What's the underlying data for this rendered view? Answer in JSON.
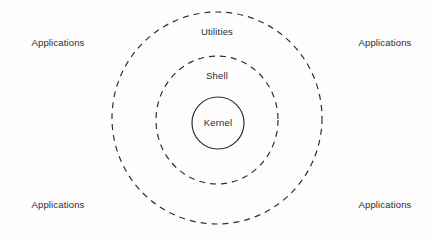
{
  "diagram": {
    "background_color": "#fdfdfd",
    "stroke_color": "#2f2f2f",
    "text_color": "#2b2b2b",
    "rings": [
      {
        "id": "utilities",
        "label": "Utilities",
        "shape": "ellipse",
        "style": "dashed",
        "cx": 217,
        "cy": 118,
        "rx": 105,
        "ry": 106,
        "label_x": 217,
        "label_y": 32
      },
      {
        "id": "shell",
        "label": "Shell",
        "shape": "ellipse",
        "style": "dashed",
        "cx": 217,
        "cy": 120,
        "rx": 61,
        "ry": 64,
        "label_x": 217,
        "label_y": 76
      },
      {
        "id": "kernel",
        "label": "Kernel",
        "shape": "circle",
        "style": "solid",
        "cx": 218,
        "cy": 123,
        "rx": 26,
        "ry": 26,
        "label_x": 218,
        "label_y": 123
      }
    ],
    "corner_labels": [
      {
        "id": "applications-top-left",
        "label": "Applications",
        "x": 58,
        "y": 43
      },
      {
        "id": "applications-top-right",
        "label": "Applications",
        "x": 385,
        "y": 43
      },
      {
        "id": "applications-bottom-left",
        "label": "Applications",
        "x": 58,
        "y": 205
      },
      {
        "id": "applications-bottom-right",
        "label": "Applications",
        "x": 385,
        "y": 205
      }
    ]
  }
}
